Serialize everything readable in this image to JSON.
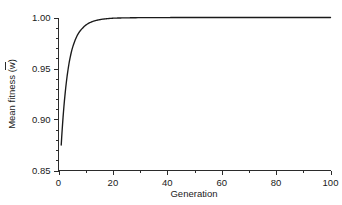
{
  "chart_data": {
    "type": "line",
    "title": "",
    "xlabel": "Generation",
    "ylabel": "Mean fitness (w̄)",
    "ylabel_plain": "Mean fitness (w)",
    "ylabel_symbol": "w",
    "ylabel_prefix": "Mean fitness (",
    "ylabel_suffix": ")",
    "xlim": [
      0,
      100
    ],
    "ylim": [
      0.85,
      1.0
    ],
    "grid": false,
    "legend": false,
    "legend_position": "none",
    "line_color": "#1a1a1a",
    "axis_color": "#2b2b2b",
    "background_color": "#ffffff",
    "xticks": [
      0,
      20,
      40,
      60,
      80,
      100
    ],
    "xtick_labels": [
      "0",
      "20",
      "40",
      "60",
      "80",
      "100"
    ],
    "xticks_minor": [
      10,
      30,
      50,
      70,
      90
    ],
    "yticks": [
      0.85,
      0.9,
      0.95,
      1.0
    ],
    "ytick_labels": [
      "0.85",
      "0.90",
      "0.95",
      "1.00"
    ],
    "yticks_minor": [
      0.86,
      0.87,
      0.88,
      0.89,
      0.91,
      0.92,
      0.93,
      0.94,
      0.96,
      0.97,
      0.98,
      0.99
    ],
    "series": [
      {
        "name": "Mean fitness",
        "x": [
          1,
          2,
          3,
          4,
          5,
          6,
          7,
          8,
          9,
          10,
          11,
          12,
          13,
          14,
          15,
          16,
          17,
          18,
          19,
          20,
          22,
          24,
          26,
          28,
          30,
          34,
          38,
          42,
          46,
          50,
          55,
          60,
          65,
          70,
          75,
          80,
          85,
          90,
          95,
          100
        ],
        "values": [
          0.875,
          0.913,
          0.939,
          0.957,
          0.969,
          0.977,
          0.983,
          0.987,
          0.99,
          0.9925,
          0.9942,
          0.9955,
          0.9965,
          0.9972,
          0.9978,
          0.9983,
          0.9986,
          0.9989,
          0.9991,
          0.9993,
          0.9995,
          0.9996,
          0.9997,
          0.99978,
          0.99983,
          0.9999,
          0.99994,
          0.99996,
          0.99997,
          0.99998,
          0.99999,
          0.99999,
          1.0,
          1.0,
          1.0,
          1.0,
          1.0,
          1.0,
          1.0,
          1.0
        ]
      }
    ]
  },
  "figure": {
    "caption": ""
  }
}
